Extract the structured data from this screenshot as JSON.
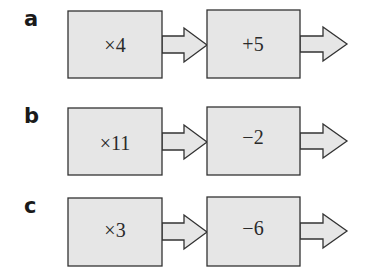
{
  "rows": [
    {
      "label": "a",
      "ops": [
        "×4",
        "+5"
      ]
    },
    {
      "label": "b",
      "ops": [
        "×11",
        "−2"
      ]
    },
    {
      "label": "c",
      "ops": [
        "×3",
        "−6"
      ]
    }
  ],
  "colors": {
    "box_fill": "#e6e6e6",
    "stroke": "#333333"
  }
}
